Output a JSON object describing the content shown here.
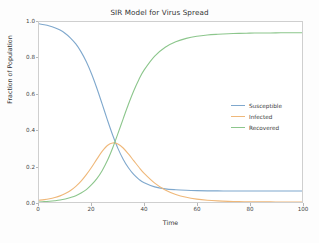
{
  "chart_data": {
    "type": "line",
    "title": "SIR Model for Virus Spread",
    "xlabel": "Time",
    "ylabel": "Fraction of Population",
    "xlim": [
      0,
      100
    ],
    "ylim": [
      0.0,
      1.0
    ],
    "grid": false,
    "legend_position": "center right",
    "xticks": [
      0,
      20,
      40,
      60,
      80,
      100
    ],
    "xtick_labels": [
      "0",
      "20",
      "40",
      "60",
      "80",
      "100"
    ],
    "yticks": [
      0.0,
      0.2,
      0.4,
      0.6,
      0.8,
      1.0
    ],
    "ytick_labels": [
      "0.0",
      "0.2",
      "0.4",
      "0.6",
      "0.8",
      "1.0"
    ],
    "x": [
      0,
      2,
      4,
      6,
      8,
      10,
      12,
      14,
      16,
      18,
      20,
      22,
      24,
      26,
      28,
      30,
      32,
      34,
      36,
      38,
      40,
      44,
      48,
      52,
      56,
      60,
      64,
      68,
      72,
      76,
      80,
      84,
      88,
      92,
      96,
      100
    ],
    "series": [
      {
        "name": "Susceptible",
        "color": "#7fa8cd",
        "values": [
          0.99,
          0.985,
          0.978,
          0.968,
          0.955,
          0.936,
          0.911,
          0.878,
          0.834,
          0.779,
          0.711,
          0.632,
          0.545,
          0.456,
          0.372,
          0.298,
          0.238,
          0.19,
          0.153,
          0.126,
          0.107,
          0.084,
          0.073,
          0.068,
          0.065,
          0.063,
          0.062,
          0.062,
          0.061,
          0.061,
          0.061,
          0.061,
          0.061,
          0.061,
          0.061,
          0.061
        ]
      },
      {
        "name": "Infected",
        "color": "#efb87a",
        "values": [
          0.01,
          0.013,
          0.018,
          0.025,
          0.034,
          0.047,
          0.064,
          0.087,
          0.116,
          0.152,
          0.193,
          0.238,
          0.281,
          0.314,
          0.328,
          0.322,
          0.3,
          0.267,
          0.23,
          0.193,
          0.159,
          0.105,
          0.067,
          0.042,
          0.026,
          0.016,
          0.0098,
          0.006,
          0.0037,
          0.0022,
          0.0014,
          0.0008,
          0.0005,
          0.0003,
          0.0002,
          0.0001
        ]
      },
      {
        "name": "Recovered",
        "color": "#8cc68c",
        "values": [
          0.0,
          0.002,
          0.004,
          0.007,
          0.011,
          0.017,
          0.025,
          0.035,
          0.05,
          0.069,
          0.096,
          0.13,
          0.174,
          0.23,
          0.3,
          0.38,
          0.462,
          0.543,
          0.617,
          0.681,
          0.734,
          0.811,
          0.86,
          0.89,
          0.909,
          0.921,
          0.928,
          0.932,
          0.935,
          0.937,
          0.938,
          0.939,
          0.939,
          0.94,
          0.94,
          0.94
        ]
      }
    ],
    "annotations": []
  }
}
